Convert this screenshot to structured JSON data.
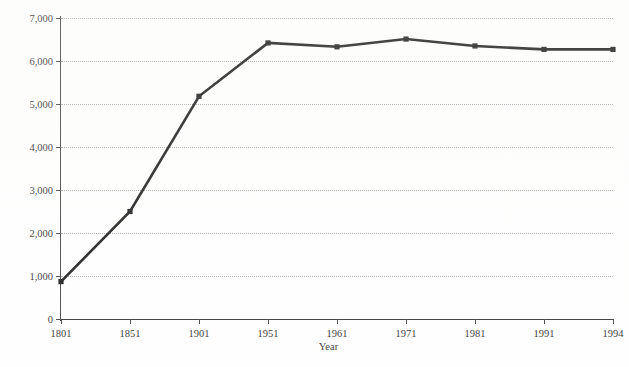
{
  "chart_data": {
    "type": "line",
    "title": "",
    "xlabel": "Year",
    "ylabel": "Population ('000s)",
    "categories": [
      "1801",
      "1851",
      "1901",
      "1951",
      "1961",
      "1971",
      "1981",
      "1991",
      "1994"
    ],
    "values": [
      870,
      2500,
      5180,
      6420,
      6330,
      6510,
      6350,
      6270,
      6270
    ],
    "series": [
      {
        "name": "Population",
        "values": [
          870,
          2500,
          5180,
          6420,
          6330,
          6510,
          6350,
          6270,
          6270
        ]
      }
    ],
    "ylim": [
      0,
      7000
    ],
    "ytick_values": [
      0,
      1000,
      2000,
      3000,
      4000,
      5000,
      6000,
      7000
    ],
    "ytick_labels": [
      "0",
      "1,000",
      "2,000",
      "3,000",
      "4,000",
      "5,000",
      "6,000",
      "7,000"
    ],
    "xtick_labels": [
      "1801",
      "1851",
      "1901",
      "1951",
      "1961",
      "1971",
      "1981",
      "1991",
      "1994"
    ],
    "grid": "horizontal-dotted",
    "legend": "none",
    "line_color": "#0d0d0d",
    "marker": "square",
    "gridline_color": "#9a9a9a",
    "axis_color": "#2a2a2a",
    "background_color": "#fefefe"
  },
  "axes": {
    "x_title": "Year",
    "y_title": "Population ('000s)"
  }
}
